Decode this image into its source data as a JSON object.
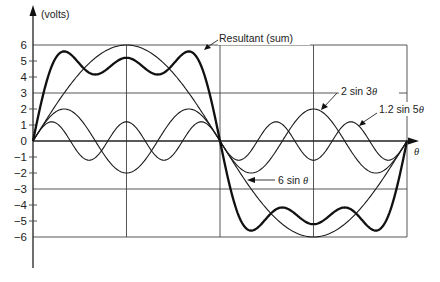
{
  "chart_data": {
    "type": "line",
    "title": "",
    "xlabel": "θ",
    "ylabel": "(volts)",
    "x_range_degrees": [
      0,
      360
    ],
    "ylim": [
      -6,
      6
    ],
    "y_ticks": [
      6,
      5,
      4,
      3,
      2,
      1,
      0,
      -1,
      -2,
      -3,
      -4,
      -5,
      -6
    ],
    "y_tick_labels": [
      "6",
      "5",
      "4",
      "3",
      "2",
      "1",
      "0",
      "−1",
      "−2",
      "−3",
      "−4",
      "−5",
      "−6"
    ],
    "horizontal_gridlines": [
      6,
      3,
      0,
      -3,
      -6
    ],
    "vertical_gridlines_degrees": [
      90,
      180,
      270,
      360
    ],
    "grid": true,
    "series": [
      {
        "name": "6 sin θ",
        "amplitude": 6,
        "harmonic": 1,
        "style": "thin",
        "x": [
          0,
          45,
          90,
          135,
          180,
          225,
          270,
          315,
          360
        ],
        "values": [
          0,
          4.24,
          6,
          4.24,
          0,
          -4.24,
          -6,
          -4.24,
          0
        ]
      },
      {
        "name": "2 sin 3θ",
        "amplitude": 2,
        "harmonic": 3,
        "style": "thin",
        "x": [
          0,
          30,
          90,
          150,
          180,
          210,
          270,
          330,
          360
        ],
        "values": [
          0,
          2,
          -2,
          2,
          0,
          -2,
          2,
          -2,
          0
        ]
      },
      {
        "name": "1.2 sin 5θ",
        "amplitude": 1.2,
        "harmonic": 5,
        "style": "thin",
        "x": [
          0,
          18,
          54,
          90,
          126,
          162,
          180,
          198,
          234,
          270,
          306,
          342,
          360
        ],
        "values": [
          0,
          1.2,
          -1.2,
          1.2,
          -1.2,
          1.2,
          0,
          -1.2,
          1.2,
          -1.2,
          1.2,
          -1.2,
          0
        ]
      },
      {
        "name": "Resultant (sum)",
        "style": "bold",
        "components": [
          "6 sin θ",
          "2 sin 3θ",
          "1.2 sin 5θ"
        ],
        "x": [
          0,
          22,
          50,
          90,
          130,
          158,
          180,
          202,
          230,
          270,
          310,
          338,
          360
        ],
        "values": [
          0,
          5.4,
          4.2,
          5.2,
          4.2,
          5.4,
          0,
          -5.4,
          -4.2,
          -5.2,
          -4.2,
          -5.4,
          0
        ]
      }
    ],
    "annotations": [
      {
        "text": "Resultant (sum)",
        "points_to": "Resultant (sum)"
      },
      {
        "text": "2 sin 3θ",
        "points_to": "2 sin 3θ"
      },
      {
        "text": "1.2 sin 5θ",
        "points_to": "1.2 sin 5θ"
      },
      {
        "text": "6 sin θ",
        "points_to": "6 sin θ"
      }
    ]
  },
  "labels": {
    "ylabel": "(volts)",
    "xlabel": "θ",
    "resultant": "Resultant (sum)",
    "two_sin_prefix": "2 sin 3",
    "theta": "θ",
    "onetwo_sin_prefix": "1.2 sin 5",
    "six_sin_prefix": "6 sin "
  }
}
